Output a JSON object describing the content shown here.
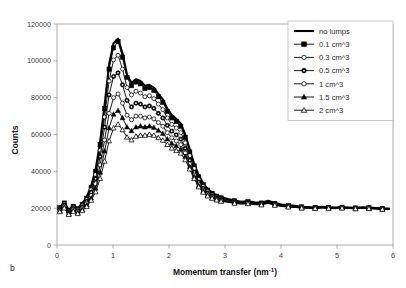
{
  "panel": {
    "label": "b"
  },
  "axes": {
    "y": {
      "title": "Counts",
      "min": 0,
      "max": 120000,
      "ticks": [
        0,
        20000,
        40000,
        60000,
        80000,
        100000,
        120000
      ],
      "tick_labels": [
        "0",
        "20000",
        "40000",
        "60000",
        "80000",
        "100000",
        "120000"
      ]
    },
    "x": {
      "title": "Momentum transfer (nm⁻¹)",
      "title_base": "Momentum transfer (nm",
      "title_sup": "-1",
      "title_tail": ")",
      "min": 0,
      "max": 6,
      "ticks": [
        0,
        1,
        2,
        3,
        4,
        5,
        6
      ],
      "tick_labels": [
        "0",
        "1",
        "2",
        "3",
        "4",
        "5",
        "6"
      ]
    }
  },
  "legend": {
    "position": "top-right",
    "entries": [
      {
        "label": "no lumps",
        "marker": "none",
        "color": "#000000",
        "line_width": 2.1
      },
      {
        "label": "0.1 cm^3",
        "marker": "filled-square",
        "color": "#000000",
        "line_width": 0.9
      },
      {
        "label": "0.3 cm^3",
        "marker": "open-circle",
        "color": "#000000",
        "line_width": 0.9
      },
      {
        "label": "0.5 cm^3",
        "marker": "half-circle",
        "color": "#000000",
        "line_width": 0.9
      },
      {
        "label": "1 cm^3",
        "marker": "open-circle",
        "color": "#000000",
        "line_width": 0.9
      },
      {
        "label": "1.5 cm^3",
        "marker": "filled-triangle",
        "color": "#000000",
        "line_width": 0.9
      },
      {
        "label": "2 cm^3",
        "marker": "open-triangle",
        "color": "#000000",
        "line_width": 0.9
      }
    ]
  },
  "chart_data": {
    "type": "line",
    "title": "",
    "xlabel": "Momentum transfer (nm^-1)",
    "ylabel": "Counts",
    "xlim": [
      0,
      6
    ],
    "ylim": [
      0,
      120000
    ],
    "grid": false,
    "legend_position": "top-right",
    "x": [
      0.05,
      0.13,
      0.21,
      0.29,
      0.37,
      0.45,
      0.53,
      0.61,
      0.69,
      0.77,
      0.85,
      0.93,
      1.01,
      1.09,
      1.17,
      1.25,
      1.33,
      1.41,
      1.49,
      1.57,
      1.65,
      1.73,
      1.81,
      1.89,
      1.97,
      2.05,
      2.13,
      2.21,
      2.29,
      2.37,
      2.45,
      2.53,
      2.61,
      2.69,
      2.77,
      2.85,
      2.93,
      3.05,
      3.17,
      3.29,
      3.41,
      3.53,
      3.65,
      3.77,
      3.89,
      4.01,
      4.13,
      4.25,
      4.37,
      4.49,
      4.61,
      4.73,
      4.85,
      4.97,
      5.09,
      5.21,
      5.33,
      5.45,
      5.57,
      5.69,
      5.81,
      5.93
    ],
    "series": [
      {
        "name": "no lumps",
        "marker": "none",
        "values": [
          20500,
          23200,
          19000,
          21500,
          20000,
          22500,
          26000,
          32000,
          41000,
          56000,
          76000,
          98000,
          109500,
          112000,
          104000,
          92500,
          88000,
          90000,
          89000,
          86500,
          87000,
          85500,
          82000,
          79000,
          74000,
          70500,
          68500,
          66000,
          60000,
          52000,
          44000,
          38000,
          33500,
          30500,
          28500,
          27000,
          26000,
          25000,
          24200,
          23500,
          23800,
          23200,
          23000,
          24000,
          22800,
          22000,
          21500,
          21300,
          20800,
          20600,
          20400,
          20700,
          20500,
          20300,
          20600,
          20400,
          20200,
          20500,
          20300,
          20100,
          19900,
          19800
        ]
      },
      {
        "name": "0.1 cm^3",
        "marker": "filled-square",
        "values": [
          20200,
          22800,
          18600,
          21000,
          19600,
          22000,
          25400,
          31200,
          40000,
          54500,
          74000,
          95500,
          107000,
          110500,
          102000,
          91000,
          86500,
          88500,
          87500,
          85000,
          85500,
          84000,
          80500,
          77500,
          72500,
          69000,
          67000,
          64500,
          58500,
          50500,
          43000,
          37000,
          32800,
          29800,
          28000,
          26500,
          25600,
          24700,
          24000,
          23300,
          23500,
          23000,
          22800,
          23700,
          22600,
          21800,
          21300,
          21100,
          20700,
          20500,
          20300,
          20600,
          20400,
          20200,
          20500,
          20300,
          20100,
          20400,
          20200,
          20000,
          19800,
          19700
        ]
      },
      {
        "name": "0.3 cm^3",
        "marker": "open-circle",
        "values": [
          19800,
          22300,
          18200,
          20500,
          19100,
          21400,
          24600,
          30000,
          38200,
          51500,
          69500,
          89000,
          100500,
          103000,
          95500,
          85500,
          81500,
          83500,
          82500,
          80500,
          81000,
          79500,
          76500,
          73500,
          69000,
          65500,
          63500,
          61000,
          55500,
          48500,
          41500,
          35500,
          31800,
          29000,
          27200,
          25900,
          25000,
          24200,
          23600,
          23000,
          23200,
          22700,
          22500,
          23400,
          22300,
          21600,
          21100,
          20900,
          20500,
          20400,
          20200,
          20500,
          20300,
          20100,
          20400,
          20200,
          20000,
          20300,
          20100,
          19900,
          19700,
          19600
        ]
      },
      {
        "name": "0.5 cm^3",
        "marker": "half-circle",
        "values": [
          19300,
          21700,
          17800,
          19900,
          18600,
          20700,
          23700,
          28600,
          36000,
          48000,
          64000,
          81500,
          91500,
          93500,
          87000,
          78500,
          75000,
          77000,
          76500,
          75000,
          75500,
          74200,
          71500,
          69000,
          65000,
          61800,
          59800,
          57500,
          52500,
          46000,
          39500,
          34200,
          30800,
          28200,
          26600,
          25400,
          24600,
          23900,
          23300,
          22800,
          23000,
          22500,
          22300,
          23200,
          22100,
          21400,
          21000,
          20800,
          20400,
          20300,
          20100,
          20400,
          20200,
          20000,
          20300,
          20100,
          19900,
          20200,
          20000,
          19800,
          19600,
          19500
        ]
      },
      {
        "name": "1 cm^3",
        "marker": "open-circle",
        "values": [
          18800,
          21000,
          17300,
          19200,
          18000,
          19800,
          22500,
          26800,
          33200,
          43500,
          57000,
          71500,
          80000,
          82000,
          77000,
          70500,
          68000,
          70000,
          70000,
          69000,
          69500,
          68500,
          66500,
          64500,
          61000,
          58200,
          56500,
          54500,
          50000,
          44000,
          38000,
          33000,
          29800,
          27500,
          26000,
          24900,
          24200,
          23600,
          23000,
          22600,
          22800,
          22300,
          22100,
          23000,
          21900,
          21300,
          20900,
          20700,
          20300,
          20200,
          20000,
          20300,
          20100,
          19900,
          20200,
          20000,
          19800,
          20100,
          19900,
          19700,
          19500,
          19400
        ]
      },
      {
        "name": "1.5 cm^3",
        "marker": "filled-triangle",
        "values": [
          18400,
          20500,
          16900,
          18700,
          17500,
          19200,
          21600,
          25400,
          30800,
          39500,
          51000,
          63500,
          71000,
          73000,
          69000,
          64000,
          62000,
          64000,
          64500,
          64000,
          64500,
          63800,
          62200,
          60500,
          57500,
          55200,
          53800,
          52000,
          48000,
          42500,
          37000,
          32200,
          29200,
          27000,
          25600,
          24600,
          23900,
          23400,
          22800,
          22400,
          22600,
          22100,
          21900,
          22800,
          21700,
          21100,
          20700,
          20500,
          20100,
          20000,
          19900,
          20200,
          20000,
          19800,
          20100,
          19900,
          19700,
          20000,
          19800,
          19600,
          19400,
          19300
        ]
      },
      {
        "name": "2 cm^3",
        "marker": "open-triangle",
        "values": [
          18000,
          20000,
          16500,
          18200,
          17000,
          18600,
          20800,
          24200,
          28800,
          36000,
          45500,
          56500,
          63500,
          65500,
          62500,
          58500,
          57000,
          59000,
          59500,
          59500,
          60000,
          59500,
          58200,
          56800,
          54500,
          52500,
          51200,
          49800,
          46200,
          41200,
          36000,
          31500,
          28600,
          26600,
          25300,
          24400,
          23700,
          23200,
          22600,
          22200,
          22400,
          21900,
          21700,
          22600,
          21500,
          20900,
          20600,
          20400,
          20000,
          19900,
          19800,
          20100,
          19900,
          19700,
          20000,
          19800,
          19600,
          19900,
          19700,
          19500,
          19300,
          19200
        ]
      }
    ]
  }
}
